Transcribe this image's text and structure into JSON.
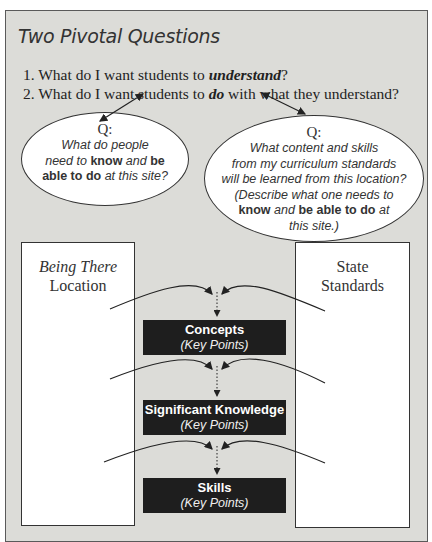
{
  "caption_partial": "g by d   g",
  "title": "Two Pivotal Questions",
  "questions": [
    {
      "number": "1.",
      "prefix": "What do I want students to ",
      "emphasis": "understand",
      "suffix": "?"
    },
    {
      "number": "2.",
      "prefix": "What do I want students to ",
      "emphasis": "do",
      "suffix": " with what they understand?"
    }
  ],
  "left_bubble": {
    "label": "Q:",
    "line1": "What do people",
    "line2_pre": "need to ",
    "line2_b1": "know",
    "line2_mid": " and ",
    "line2_b2": "be",
    "line3_b": "able to do",
    "line3_post": " at this site?"
  },
  "right_bubble": {
    "label": "Q:",
    "line1": "What content and skills",
    "line2": "from my curriculum standards",
    "line3": "will be learned from this location?",
    "line4": "(Describe what one needs to",
    "line5_b1": "know",
    "line5_mid": " and ",
    "line5_b2": "be able to do",
    "line5_post": " at",
    "line6": "this site.)"
  },
  "left_column": {
    "line1": "Being There",
    "line2": "Location"
  },
  "right_column": {
    "line1": "State",
    "line2": "Standards"
  },
  "stages": [
    {
      "heading": "Concepts",
      "sub": "(Key Points)"
    },
    {
      "heading": "Significant Knowledge",
      "sub": "(Key Points)"
    },
    {
      "heading": "Skills",
      "sub": "(Key Points)"
    }
  ],
  "colors": {
    "panel": "#dcdcd8",
    "dark_box": "#1e1e1e",
    "line": "#222222"
  }
}
